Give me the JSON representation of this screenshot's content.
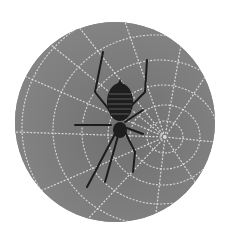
{
  "image": {
    "alt": "Spider on a dewy web",
    "subject": "spider-on-web",
    "shape": "circle",
    "colors": {
      "background": "#ffffff",
      "disc": "#7d7d7d",
      "silk": "#e6e6e6",
      "spider": "#1e1e1e"
    }
  }
}
